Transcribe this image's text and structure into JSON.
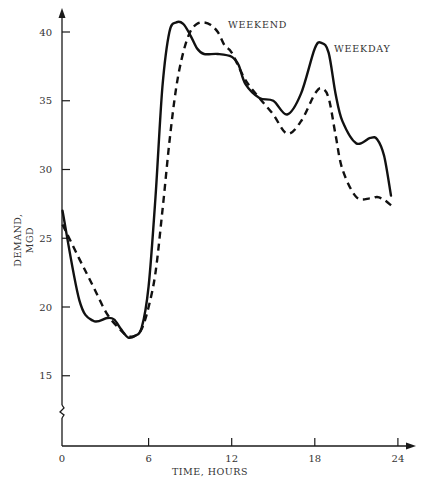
{
  "chart_data": {
    "type": "line",
    "title": "",
    "xlabel": "TIME, HOURS",
    "ylabel": [
      "DEMAND,",
      "MGD"
    ],
    "xlim": [
      0,
      24
    ],
    "ylim": [
      11,
      41
    ],
    "y_axis_break": true,
    "grid": false,
    "legend": "inline labels",
    "x_ticks": [
      0,
      6,
      12,
      18,
      24
    ],
    "x_tick_labels": [
      "0",
      "6",
      "12",
      "18",
      "24"
    ],
    "y_ticks": [
      15,
      20,
      25,
      30,
      35,
      40
    ],
    "y_tick_labels": [
      "15",
      "20",
      "25",
      "30",
      "35",
      "40"
    ],
    "series": [
      {
        "name": "WEEKDAY",
        "style": "solid",
        "x": [
          0,
          1,
          2,
          3,
          3.5,
          4,
          4.5,
          5,
          5.5,
          6,
          6.5,
          7,
          7.5,
          8,
          8.5,
          9,
          9.5,
          10,
          11,
          12,
          12.5,
          13,
          14,
          15,
          16,
          17,
          18,
          18.5,
          19,
          19.5,
          20,
          21,
          22,
          22.5,
          23,
          23.5
        ],
        "values": [
          27,
          20.5,
          19.0,
          19.2,
          19.1,
          18.4,
          17.8,
          17.9,
          18.5,
          21.5,
          28,
          36,
          40,
          40.7,
          40.6,
          39.8,
          38.8,
          38.4,
          38.4,
          38.2,
          37.6,
          36.2,
          35.2,
          35.0,
          34.0,
          35.5,
          38.8,
          39.2,
          38.5,
          35.5,
          33.5,
          31.9,
          32.3,
          32.2,
          31.0,
          28.1
        ]
      },
      {
        "name": "WEEKEND",
        "style": "dashed",
        "x": [
          0,
          1,
          2,
          3,
          4,
          4.5,
          5,
          5.5,
          6,
          6.5,
          7,
          7.5,
          8,
          8.5,
          9,
          9.5,
          10,
          10.5,
          11,
          11.5,
          12,
          13,
          14,
          15,
          16,
          17,
          18,
          18.5,
          19,
          19.5,
          20,
          21,
          22,
          22.5,
          23,
          23.5
        ],
        "values": [
          26,
          23.5,
          21.5,
          19.5,
          18.3,
          17.9,
          17.9,
          18.4,
          20,
          22.5,
          27,
          32,
          36,
          38.5,
          40,
          40.6,
          40.7,
          40.5,
          40.0,
          39.0,
          38.5,
          36.5,
          35.2,
          34.0,
          32.6,
          33.5,
          35.5,
          35.9,
          35.2,
          32.5,
          30.0,
          28.0,
          27.9,
          28.0,
          27.8,
          27.4
        ]
      }
    ],
    "annotations": [
      {
        "text": "WEEKEND",
        "near_x": 11.5,
        "near_y": 40.5
      },
      {
        "text": "WEEKDAY",
        "near_x": 19.5,
        "near_y": 38.7
      }
    ],
    "colors": {
      "line": "#111111",
      "axis": "#1a1a1a",
      "text": "#333333",
      "background": "#ffffff"
    }
  }
}
